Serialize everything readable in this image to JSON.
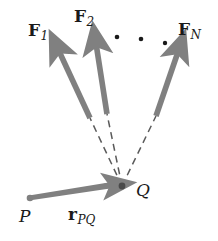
{
  "figure": {
    "colors": {
      "arrow_gray": "#808080",
      "dash_gray": "#5a5a5a",
      "node_dark": "#4a4a4a",
      "text": "#1a1a1a",
      "background": "#ffffff"
    }
  },
  "labels": {
    "force1": {
      "symbol": "F",
      "subscript": "1"
    },
    "force2": {
      "symbol": "F",
      "subscript": "2"
    },
    "forceN": {
      "symbol": "F",
      "subscript": "N"
    },
    "position_vector": {
      "symbol": "r",
      "subscript": "PQ"
    },
    "point_p": "P",
    "point_q": "Q"
  },
  "ellipsis": {
    "dot_count": 3,
    "glyph": "•"
  },
  "geometry": {
    "point_q": {
      "x": 122,
      "y": 186
    },
    "point_p": {
      "x": 29,
      "y": 198
    },
    "force_arrows": [
      {
        "name": "F1",
        "tail_x": 90,
        "tail_y": 118,
        "head_x": 56,
        "head_y": 45
      },
      {
        "name": "F2",
        "tail_x": 107,
        "tail_y": 114,
        "head_x": 95,
        "head_y": 38
      },
      {
        "name": "FN",
        "tail_x": 156,
        "tail_y": 116,
        "head_x": 181,
        "head_y": 45
      }
    ],
    "dashes": [
      {
        "from_x": 122,
        "from_y": 186,
        "to_x": 90,
        "to_y": 118
      },
      {
        "from_x": 122,
        "from_y": 186,
        "to_x": 107,
        "to_y": 114
      },
      {
        "from_x": 122,
        "from_y": 186,
        "to_x": 156,
        "to_y": 116
      }
    ],
    "dot_positions": [
      {
        "x": 117,
        "y": 37
      },
      {
        "x": 141,
        "y": 39
      },
      {
        "x": 165,
        "y": 43
      }
    ]
  }
}
